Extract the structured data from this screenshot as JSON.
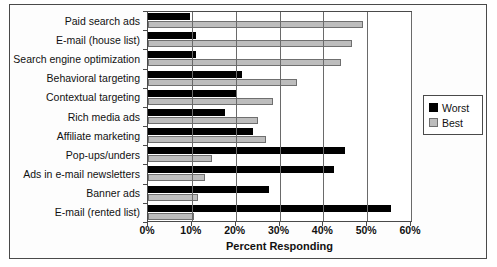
{
  "chart_data": {
    "type": "bar",
    "orientation": "horizontal",
    "title": "",
    "xlabel": "Percent Responding",
    "ylabel": "",
    "xlim": [
      0,
      60
    ],
    "xtick_labels": [
      "0%",
      "10%",
      "20%",
      "30%",
      "40%",
      "50%",
      "60%"
    ],
    "xtick_values": [
      0,
      10,
      20,
      30,
      40,
      50,
      60
    ],
    "grid": true,
    "legend_position": "right",
    "categories": [
      "Paid search ads",
      "E-mail (house list)",
      "Search engine optimization",
      "Behavioral targeting",
      "Contextual targeting",
      "Rich media ads",
      "Affiliate marketing",
      "Pop-ups/unders",
      "Ads in e-mail newsletters",
      "Banner ads",
      "E-mail (rented list)"
    ],
    "series": [
      {
        "name": "Worst",
        "color": "#000000",
        "values": [
          9.5,
          11,
          11,
          21.5,
          20,
          17.5,
          24,
          45,
          42.5,
          27.5,
          55.5
        ]
      },
      {
        "name": "Best",
        "color": "#bdbdbd",
        "values": [
          49,
          46.5,
          44,
          34,
          28.5,
          25,
          27,
          14.5,
          13,
          11.5,
          10.5
        ]
      }
    ]
  },
  "legend": {
    "items": [
      {
        "label": "Worst",
        "swatch": "worst-swatch"
      },
      {
        "label": "Best",
        "swatch": "best-swatch"
      }
    ]
  }
}
